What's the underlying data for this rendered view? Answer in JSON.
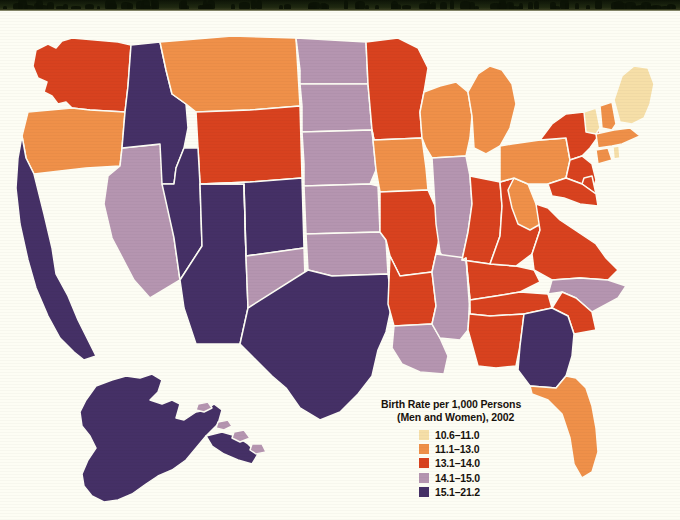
{
  "page": {
    "background_color": "#fdfdf4",
    "photo_edge_color": "#18210d"
  },
  "legend": {
    "title_line1": "Birth Rate per 1,000 Persons",
    "title_line2": "(Men and Women), 2002",
    "bins": [
      {
        "label": "10.6–11.0",
        "color": "#f6dfa8"
      },
      {
        "label": "11.1–13.0",
        "color": "#ef9049"
      },
      {
        "label": "13.1–14.0",
        "color": "#d8421f"
      },
      {
        "label": "14.1–15.0",
        "color": "#b595b0"
      },
      {
        "label": "15.1–21.2",
        "color": "#453066"
      }
    ]
  },
  "chart_data": {
    "type": "map",
    "title": "Birth Rate per 1,000 Persons (Men and Women), 2002",
    "value_unit": "births per 1,000 persons",
    "year": 2002,
    "legend_position": "bottom-center",
    "bins": [
      {
        "range": "10.6–11.0",
        "min": 10.6,
        "max": 11.0,
        "color": "#f6dfa8"
      },
      {
        "range": "11.1–13.0",
        "min": 11.1,
        "max": 13.0,
        "color": "#ef9049"
      },
      {
        "range": "13.1–14.0",
        "min": 13.1,
        "max": 14.0,
        "color": "#d8421f"
      },
      {
        "range": "14.1–15.0",
        "min": 14.1,
        "max": 15.0,
        "color": "#b595b0"
      },
      {
        "range": "15.1–21.2",
        "min": 15.1,
        "max": 21.2,
        "color": "#453066"
      }
    ],
    "regions": [
      {
        "code": "WA",
        "name": "Washington",
        "bin": "13.1–14.0",
        "color": "#d8421f"
      },
      {
        "code": "OR",
        "name": "Oregon",
        "bin": "11.1–13.0",
        "color": "#ef9049"
      },
      {
        "code": "CA",
        "name": "California",
        "bin": "15.1–21.2",
        "color": "#453066"
      },
      {
        "code": "NV",
        "name": "Nevada",
        "bin": "14.1–15.0",
        "color": "#b595b0"
      },
      {
        "code": "ID",
        "name": "Idaho",
        "bin": "15.1–21.2",
        "color": "#453066"
      },
      {
        "code": "MT",
        "name": "Montana",
        "bin": "11.1–13.0",
        "color": "#ef9049"
      },
      {
        "code": "WY",
        "name": "Wyoming",
        "bin": "13.1–14.0",
        "color": "#d8421f"
      },
      {
        "code": "UT",
        "name": "Utah",
        "bin": "15.1–21.2",
        "color": "#453066"
      },
      {
        "code": "AZ",
        "name": "Arizona",
        "bin": "15.1–21.2",
        "color": "#453066"
      },
      {
        "code": "CO",
        "name": "Colorado",
        "bin": "15.1–21.2",
        "color": "#453066"
      },
      {
        "code": "NM",
        "name": "New Mexico",
        "bin": "14.1–15.0",
        "color": "#b595b0"
      },
      {
        "code": "ND",
        "name": "North Dakota",
        "bin": "14.1–15.0",
        "color": "#b595b0"
      },
      {
        "code": "SD",
        "name": "South Dakota",
        "bin": "14.1–15.0",
        "color": "#b595b0"
      },
      {
        "code": "NE",
        "name": "Nebraska",
        "bin": "14.1–15.0",
        "color": "#b595b0"
      },
      {
        "code": "KS",
        "name": "Kansas",
        "bin": "14.1–15.0",
        "color": "#b595b0"
      },
      {
        "code": "OK",
        "name": "Oklahoma",
        "bin": "14.1–15.0",
        "color": "#b595b0"
      },
      {
        "code": "TX",
        "name": "Texas",
        "bin": "15.1–21.2",
        "color": "#453066"
      },
      {
        "code": "MN",
        "name": "Minnesota",
        "bin": "13.1–14.0",
        "color": "#d8421f"
      },
      {
        "code": "IA",
        "name": "Iowa",
        "bin": "11.1–13.0",
        "color": "#ef9049"
      },
      {
        "code": "MO",
        "name": "Missouri",
        "bin": "13.1–14.0",
        "color": "#d8421f"
      },
      {
        "code": "AR",
        "name": "Arkansas",
        "bin": "13.1–14.0",
        "color": "#d8421f"
      },
      {
        "code": "LA",
        "name": "Louisiana",
        "bin": "14.1–15.0",
        "color": "#b595b0"
      },
      {
        "code": "WI",
        "name": "Wisconsin",
        "bin": "11.1–13.0",
        "color": "#ef9049"
      },
      {
        "code": "IL",
        "name": "Illinois",
        "bin": "14.1–15.0",
        "color": "#b595b0"
      },
      {
        "code": "MS",
        "name": "Mississippi",
        "bin": "14.1–15.0",
        "color": "#b595b0"
      },
      {
        "code": "MI",
        "name": "Michigan",
        "bin": "11.1–13.0",
        "color": "#ef9049"
      },
      {
        "code": "IN",
        "name": "Indiana",
        "bin": "13.1–14.0",
        "color": "#d8421f"
      },
      {
        "code": "KY",
        "name": "Kentucky",
        "bin": "13.1–14.0",
        "color": "#d8421f"
      },
      {
        "code": "TN",
        "name": "Tennessee",
        "bin": "13.1–14.0",
        "color": "#d8421f"
      },
      {
        "code": "AL",
        "name": "Alabama",
        "bin": "13.1–14.0",
        "color": "#d8421f"
      },
      {
        "code": "OH",
        "name": "Ohio",
        "bin": "13.1–14.0",
        "color": "#d8421f"
      },
      {
        "code": "WV",
        "name": "West Virginia",
        "bin": "11.1–13.0",
        "color": "#ef9049"
      },
      {
        "code": "VA",
        "name": "Virginia",
        "bin": "13.1–14.0",
        "color": "#d8421f"
      },
      {
        "code": "NC",
        "name": "North Carolina",
        "bin": "14.1–15.0",
        "color": "#b595b0"
      },
      {
        "code": "SC",
        "name": "South Carolina",
        "bin": "13.1–14.0",
        "color": "#d8421f"
      },
      {
        "code": "GA",
        "name": "Georgia",
        "bin": "15.1–21.2",
        "color": "#453066"
      },
      {
        "code": "FL",
        "name": "Florida",
        "bin": "11.1–13.0",
        "color": "#ef9049"
      },
      {
        "code": "PA",
        "name": "Pennsylvania",
        "bin": "11.1–13.0",
        "color": "#ef9049"
      },
      {
        "code": "NY",
        "name": "New York",
        "bin": "13.1–14.0",
        "color": "#d8421f"
      },
      {
        "code": "NJ",
        "name": "New Jersey",
        "bin": "13.1–14.0",
        "color": "#d8421f"
      },
      {
        "code": "DE",
        "name": "Delaware",
        "bin": "13.1–14.0",
        "color": "#d8421f"
      },
      {
        "code": "MD",
        "name": "Maryland",
        "bin": "13.1–14.0",
        "color": "#d8421f"
      },
      {
        "code": "CT",
        "name": "Connecticut",
        "bin": "11.1–13.0",
        "color": "#ef9049"
      },
      {
        "code": "RI",
        "name": "Rhode Island",
        "bin": "10.6–11.0",
        "color": "#f6dfa8"
      },
      {
        "code": "MA",
        "name": "Massachusetts",
        "bin": "11.1–13.0",
        "color": "#ef9049"
      },
      {
        "code": "VT",
        "name": "Vermont",
        "bin": "10.6–11.0",
        "color": "#f6dfa8"
      },
      {
        "code": "NH",
        "name": "New Hampshire",
        "bin": "11.1–13.0",
        "color": "#ef9049"
      },
      {
        "code": "ME",
        "name": "Maine",
        "bin": "10.6–11.0",
        "color": "#f6dfa8"
      },
      {
        "code": "AK",
        "name": "Alaska",
        "bin": "15.1–21.2",
        "color": "#453066"
      },
      {
        "code": "HI",
        "name": "Hawaii",
        "bin": "14.1–15.0",
        "color": "#b595b0"
      }
    ]
  }
}
